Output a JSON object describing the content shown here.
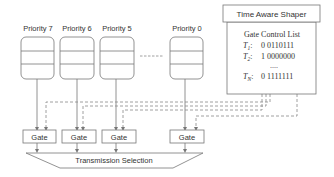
{
  "diagram": {
    "queues": [
      {
        "label": "Priority 7",
        "x": 21
      },
      {
        "label": "Priority 6",
        "x": 60
      },
      {
        "label": "Priority 5",
        "x": 100
      },
      {
        "label": "Priority 0",
        "x": 170
      }
    ],
    "ellipsis": "------",
    "gates": [
      {
        "label": "Gate"
      },
      {
        "label": "Gate"
      },
      {
        "label": "Gate"
      },
      {
        "label": "Gate"
      }
    ],
    "transmission_selection": "Transmission Selection",
    "tas": {
      "title": "Time Aware Shaper",
      "gcl_title": "Gate Control List",
      "rows": [
        {
          "t": "T",
          "sub": "1",
          "value": "0 0110111"
        },
        {
          "t": "T",
          "sub": "2",
          "value": "1 0000000"
        },
        {
          "t": "",
          "sub": "",
          "value": "...."
        },
        {
          "t": "T",
          "sub": "N",
          "value": "0 1111111"
        }
      ]
    },
    "colors": {
      "stroke": "#777777",
      "text": "#333333",
      "dash": "#888888"
    }
  }
}
